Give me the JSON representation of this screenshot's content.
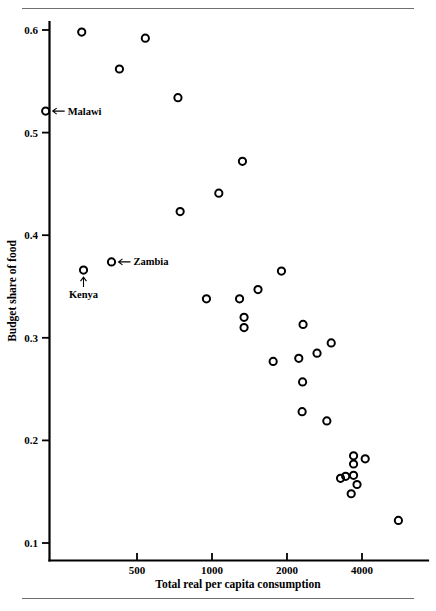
{
  "chart_data": {
    "type": "scatter",
    "title": "",
    "xlabel": "Total real per capita consumption",
    "ylabel": "Budget share of food",
    "xscale": "log",
    "yscale": "linear",
    "xticks": [
      500,
      1000,
      2000,
      4000
    ],
    "xtick_labels": [
      "500",
      "1000",
      "2000",
      "4000"
    ],
    "yticks": [
      0.1,
      0.2,
      0.3,
      0.4,
      0.5,
      0.6
    ],
    "ytick_labels": [
      "0.1",
      "0.2",
      "0.3",
      "0.4",
      "0.5",
      "0.6"
    ],
    "xlim": [
      260,
      7200
    ],
    "ylim": [
      0.082,
      0.615
    ],
    "grid": false,
    "legend": null,
    "marker": "open-circle",
    "marker_color": "#000000",
    "points": [
      {
        "x": 300,
        "y": 0.598
      },
      {
        "x": 540,
        "y": 0.592
      },
      {
        "x": 425,
        "y": 0.562
      },
      {
        "x": 730,
        "y": 0.534
      },
      {
        "x": 215,
        "y": 0.521,
        "label": "Malawi"
      },
      {
        "x": 1325,
        "y": 0.472
      },
      {
        "x": 1065,
        "y": 0.441
      },
      {
        "x": 745,
        "y": 0.423
      },
      {
        "x": 395,
        "y": 0.374,
        "label": "Zambia"
      },
      {
        "x": 305,
        "y": 0.366,
        "label": "Kenya"
      },
      {
        "x": 1900,
        "y": 0.365
      },
      {
        "x": 1530,
        "y": 0.347
      },
      {
        "x": 950,
        "y": 0.338
      },
      {
        "x": 1290,
        "y": 0.338
      },
      {
        "x": 1345,
        "y": 0.32
      },
      {
        "x": 1345,
        "y": 0.31
      },
      {
        "x": 2320,
        "y": 0.313
      },
      {
        "x": 3010,
        "y": 0.295
      },
      {
        "x": 2640,
        "y": 0.285
      },
      {
        "x": 2230,
        "y": 0.28
      },
      {
        "x": 1760,
        "y": 0.277
      },
      {
        "x": 2310,
        "y": 0.257
      },
      {
        "x": 2300,
        "y": 0.228
      },
      {
        "x": 2890,
        "y": 0.219
      },
      {
        "x": 3700,
        "y": 0.185
      },
      {
        "x": 3700,
        "y": 0.177
      },
      {
        "x": 4120,
        "y": 0.182
      },
      {
        "x": 3280,
        "y": 0.163
      },
      {
        "x": 3440,
        "y": 0.165
      },
      {
        "x": 3700,
        "y": 0.166
      },
      {
        "x": 3820,
        "y": 0.157
      },
      {
        "x": 3620,
        "y": 0.148
      },
      {
        "x": 5600,
        "y": 0.122
      }
    ],
    "annotations": [
      {
        "text": "Malawi",
        "arrow": "left",
        "target_x": 215,
        "target_y": 0.521
      },
      {
        "text": "Zambia",
        "arrow": "left",
        "target_x": 395,
        "target_y": 0.374
      },
      {
        "text": "Kenya",
        "arrow": "up",
        "target_x": 305,
        "target_y": 0.366
      }
    ]
  },
  "axis": {
    "x_title": "Total real per capita consumption",
    "y_title": "Budget share of food"
  },
  "annotations": {
    "malawi": "Malawi",
    "zambia": "Zambia",
    "kenya": "Kenya"
  }
}
